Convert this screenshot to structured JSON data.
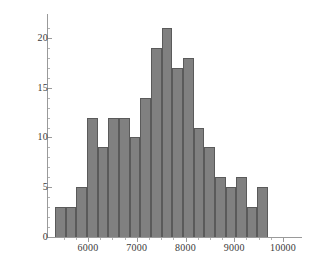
{
  "chart_data": {
    "type": "bar",
    "title": "",
    "subtitle": "",
    "xlabel": "",
    "ylabel": "",
    "grid": false,
    "legend": null,
    "xlim": [
      5325,
      9695
    ],
    "ylim": [
      0,
      22
    ],
    "bin_width": 218.5,
    "x_ticks": [
      6000,
      7000,
      8000,
      9000,
      10000
    ],
    "x_tick_labels": [
      "6000",
      "7000",
      "8000",
      "9000",
      "10000"
    ],
    "x_minor_step": 250,
    "y_ticks": [
      0,
      5,
      10,
      15,
      20
    ],
    "y_tick_labels": [
      "0",
      "5",
      "10",
      "15",
      "20"
    ],
    "y_minor_step": 1,
    "bin_edges": [
      5325,
      5543,
      5762,
      5980,
      6199,
      6417,
      6636,
      6854,
      7073,
      7291,
      7510,
      7728,
      7947,
      8165,
      8384,
      8602,
      8821,
      9039,
      9258,
      9476,
      9695
    ],
    "values": [
      3,
      3,
      5,
      12,
      9,
      12,
      12,
      10,
      14,
      19,
      21,
      17,
      18,
      11,
      9,
      6,
      5,
      6,
      3,
      5
    ],
    "categories": [
      "5325-5543",
      "5543-5762",
      "5762-5980",
      "5980-6199",
      "6199-6417",
      "6417-6636",
      "6636-6854",
      "6854-7073",
      "7073-7291",
      "7291-7510",
      "7510-7728",
      "7728-7947",
      "7947-8165",
      "8165-8384",
      "8384-8602",
      "8602-8821",
      "8821-9039",
      "9039-9258",
      "9258-9476",
      "9476-9695"
    ],
    "bar_color": "#808080",
    "bar_edge_color": "#5a5a5a",
    "axis_color": "#9a9a9a",
    "background": "#ffffff"
  }
}
